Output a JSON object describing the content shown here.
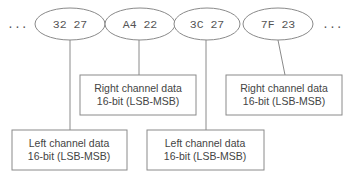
{
  "diagram": {
    "type": "audio-sample-byte-layout",
    "leading_ellipsis": "...",
    "trailing_ellipsis": "...",
    "byte_pairs": [
      {
        "label": "32 27",
        "channel": "left"
      },
      {
        "label": "A4 22",
        "channel": "right"
      },
      {
        "label": "3C 27",
        "channel": "left"
      },
      {
        "label": "7F 23",
        "channel": "right"
      }
    ],
    "boxes": [
      {
        "line1": "Left channel data",
        "line2": "16-bit (LSB-MSB)",
        "points_to": 0
      },
      {
        "line1": "Right channel data",
        "line2": "16-bit (LSB-MSB)",
        "points_to": 1
      },
      {
        "line1": "Left channel data",
        "line2": "16-bit (LSB-MSB)",
        "points_to": 2
      },
      {
        "line1": "Right channel data",
        "line2": "16-bit (LSB-MSB)",
        "points_to": 3
      }
    ],
    "colors": {
      "stroke": "#8a8a8a",
      "text": "#444444",
      "background": "#ffffff"
    }
  }
}
